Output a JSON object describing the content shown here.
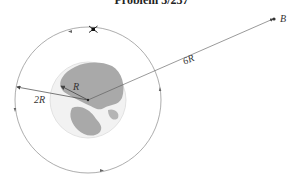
{
  "title": "Problem 3/237",
  "diagram": {
    "center": {
      "x": 88,
      "y": 100
    },
    "earth_radius_px": 38,
    "orbit_radius_px": 73,
    "labels": {
      "earth_radius": "R",
      "orbit_radius": "2R",
      "distance_to_b": "6R",
      "point_b": "B"
    },
    "colors": {
      "earth": "#a9a9a9",
      "earth_outline": "#d8d8d8",
      "orbit": "#8a8a8a",
      "lines": "#555555"
    }
  }
}
